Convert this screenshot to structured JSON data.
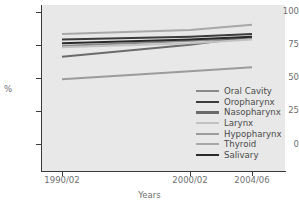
{
  "chart_data": {
    "type": "line",
    "title": "",
    "xlabel": "Years",
    "ylabel": "%",
    "x": [
      "1990/02",
      "2000/02",
      "2004/06"
    ],
    "xtick_labels": [
      "1990/02",
      "2000/02",
      "2004/06"
    ],
    "ytick_labels": [
      "0",
      "25",
      "50",
      "75",
      "100"
    ],
    "ylim": [
      -8,
      105
    ],
    "yticks": [
      0,
      25,
      50,
      75,
      100
    ],
    "grid": false,
    "legend_position": "lower-right-inside",
    "series": [
      {
        "name": "Oral Cavity",
        "color": "#8a8a8a",
        "values": [
          74,
          78,
          80
        ]
      },
      {
        "name": "Oropharynx",
        "color": "#3c3c3c",
        "values": [
          79,
          81,
          83
        ]
      },
      {
        "name": "Nasopharynx",
        "color": "#6b6b6b",
        "values": [
          66,
          75,
          81
        ]
      },
      {
        "name": "Larynx",
        "color": "#c2c2c2",
        "values": [
          73,
          76,
          79
        ]
      },
      {
        "name": "Hypopharynx",
        "color": "#9b9b9b",
        "values": [
          49,
          55,
          58
        ]
      },
      {
        "name": "Thyroid",
        "color": "#a8a8a8",
        "values": [
          83,
          86,
          90
        ]
      },
      {
        "name": "Salivary",
        "color": "#2a2a2a",
        "values": [
          76,
          79,
          81
        ]
      }
    ]
  },
  "axes": {
    "ylabel": "%",
    "xlabel": "Years",
    "ytick_0": "0",
    "ytick_25": "25",
    "ytick_50": "50",
    "ytick_75": "75",
    "ytick_100": "100",
    "xtick_0": "1990/02",
    "xtick_1": "2000/02",
    "xtick_2": "2004/06"
  },
  "legend": {
    "items": [
      {
        "label": "Oral Cavity"
      },
      {
        "label": "Oropharynx"
      },
      {
        "label": "Nasopharynx"
      },
      {
        "label": "Larynx"
      },
      {
        "label": "Hypopharynx"
      },
      {
        "label": "Thyroid"
      },
      {
        "label": "Salivary"
      }
    ]
  },
  "colors": {
    "plot_background": "#e8e8e8",
    "page_background": "#ffffff",
    "axis": "#3a3a3a",
    "tick_text": "#6f6f6f",
    "legend_text": "#4a4a4a"
  }
}
